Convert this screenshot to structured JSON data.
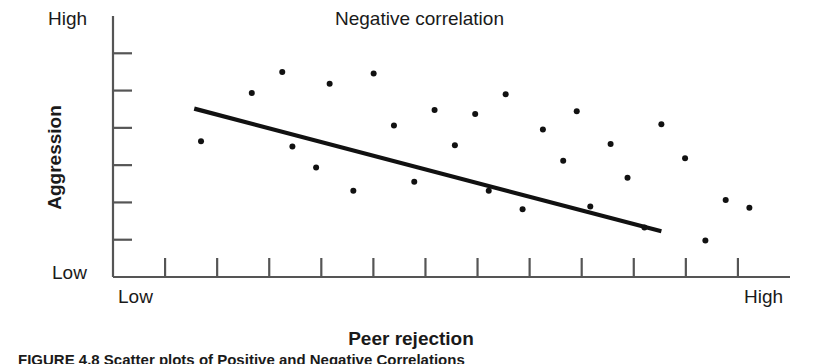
{
  "figure": {
    "caption": "FIGURE 4.8 Scatter plots of Positive and Negative Correlations"
  },
  "chart_data": {
    "type": "scatter",
    "title": "Negative correlation",
    "xlabel": "Peer rejection",
    "ylabel": "Aggression",
    "x_tick_labels": [
      "Low",
      "High"
    ],
    "y_tick_labels": [
      "Low",
      "High"
    ],
    "xlim": [
      0,
      100
    ],
    "ylim": [
      0,
      100
    ],
    "grid": false,
    "legend": null,
    "x_tick_count": 12,
    "y_tick_count": 6,
    "point_color": "#111111",
    "line_color": "#111111",
    "axis_color": "#555555",
    "points": [
      {
        "x": 13.0,
        "y": 52.0
      },
      {
        "x": 20.5,
        "y": 70.5
      },
      {
        "x": 25.0,
        "y": 78.5
      },
      {
        "x": 26.5,
        "y": 50.0
      },
      {
        "x": 30.0,
        "y": 42.0
      },
      {
        "x": 32.0,
        "y": 74.0
      },
      {
        "x": 35.5,
        "y": 33.0
      },
      {
        "x": 38.5,
        "y": 78.0
      },
      {
        "x": 41.5,
        "y": 58.0
      },
      {
        "x": 44.5,
        "y": 36.5
      },
      {
        "x": 47.5,
        "y": 64.0
      },
      {
        "x": 50.5,
        "y": 50.5
      },
      {
        "x": 53.5,
        "y": 62.5
      },
      {
        "x": 55.5,
        "y": 33.0
      },
      {
        "x": 58.0,
        "y": 70.0
      },
      {
        "x": 60.5,
        "y": 26.0
      },
      {
        "x": 63.5,
        "y": 56.5
      },
      {
        "x": 66.5,
        "y": 44.5
      },
      {
        "x": 68.5,
        "y": 63.5
      },
      {
        "x": 70.5,
        "y": 27.0
      },
      {
        "x": 73.5,
        "y": 51.0
      },
      {
        "x": 76.0,
        "y": 38.0
      },
      {
        "x": 78.5,
        "y": 19.0
      },
      {
        "x": 81.0,
        "y": 58.5
      },
      {
        "x": 84.5,
        "y": 45.5
      },
      {
        "x": 87.5,
        "y": 14.0
      },
      {
        "x": 90.5,
        "y": 29.5
      },
      {
        "x": 94.0,
        "y": 26.5
      }
    ],
    "trend_line": {
      "x0": 12.0,
      "y0": 64.5,
      "x1": 81.0,
      "y1": 17.5
    }
  }
}
